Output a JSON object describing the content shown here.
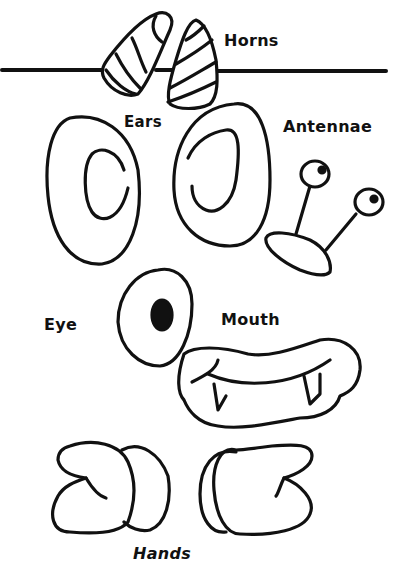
{
  "page": {
    "background": "#ffffff",
    "ink": "#111111"
  },
  "labels": {
    "horns": "Horns",
    "ears": "Ears",
    "antennae": "Antennae",
    "eye": "Eye",
    "mouth": "Mouth",
    "hands": "Hands"
  },
  "parts": [
    {
      "name": "horns",
      "count": 2,
      "icon": "striped-horn"
    },
    {
      "name": "ears",
      "count": 2,
      "icon": "oval-ear"
    },
    {
      "name": "antennae",
      "count": 1,
      "icon": "stalk-antennae"
    },
    {
      "name": "eye",
      "count": 1,
      "icon": "oval-eye"
    },
    {
      "name": "mouth",
      "count": 1,
      "icon": "fanged-mouth"
    },
    {
      "name": "hands",
      "count": 2,
      "icon": "mitten-hand"
    }
  ]
}
